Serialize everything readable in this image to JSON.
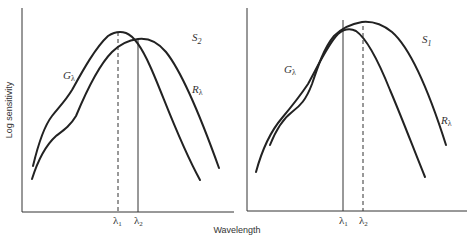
{
  "figure": {
    "y_axis_label": "Log sensitivity",
    "x_axis_label": "Wavelength",
    "panels": [
      {
        "name": "S2",
        "title_main": "S",
        "title_sub": "2",
        "curve_labels": [
          {
            "main": "G",
            "sub": "λ"
          },
          {
            "main": "R",
            "sub": "λ"
          }
        ],
        "ticks": [
          {
            "main": "λ",
            "sub": "1",
            "line": "dashed"
          },
          {
            "main": "λ",
            "sub": "2",
            "line": "solid"
          }
        ]
      },
      {
        "name": "S1",
        "title_main": "S",
        "title_sub": "1",
        "curve_labels": [
          {
            "main": "G",
            "sub": "λ"
          },
          {
            "main": "R",
            "sub": "λ"
          }
        ],
        "ticks": [
          {
            "main": "λ",
            "sub": "1",
            "line": "solid"
          },
          {
            "main": "λ",
            "sub": "2",
            "line": "dashed"
          }
        ]
      }
    ]
  }
}
